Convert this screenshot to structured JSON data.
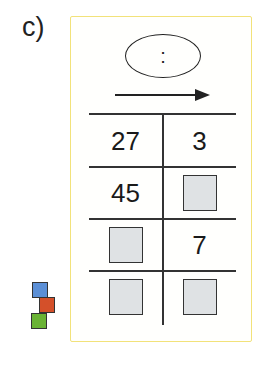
{
  "exercise": {
    "label": "c)",
    "operator_symbol": ":",
    "arrow_direction": "right",
    "table": {
      "rows": [
        {
          "left": "27",
          "right": "3"
        },
        {
          "left": "45",
          "right": ""
        },
        {
          "left": "",
          "right": "7"
        },
        {
          "left": "",
          "right": ""
        }
      ],
      "blank_cell_style": "gray-box"
    },
    "cubes_icon": {
      "colors": [
        "#5b8fd6",
        "#d4502a",
        "#6ab335"
      ]
    }
  }
}
